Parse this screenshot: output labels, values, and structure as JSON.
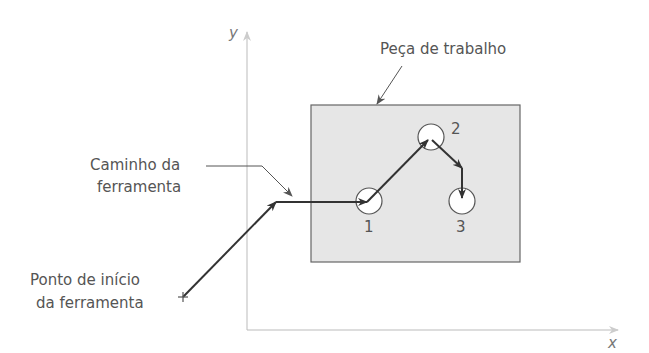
{
  "axes": {
    "x_label": "x",
    "y_label": "y"
  },
  "labels": {
    "workpiece": "Peça de trabalho",
    "tool_path_line1": "Caminho da",
    "tool_path_line2": "ferramenta",
    "start_line1": "Ponto de início",
    "start_line2": "da ferramenta"
  },
  "points": [
    {
      "id": "1",
      "label": "1"
    },
    {
      "id": "2",
      "label": "2"
    },
    {
      "id": "3",
      "label": "3"
    }
  ],
  "colors": {
    "workpiece_fill": "#e6e6e6",
    "path": "#333333",
    "axis": "#bbbbbb",
    "text": "#555555"
  }
}
